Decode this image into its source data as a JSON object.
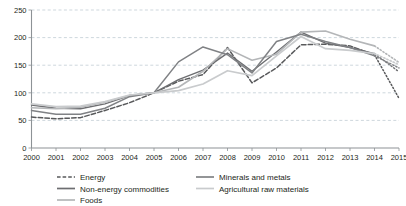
{
  "chart_data": {
    "type": "line",
    "title": "",
    "subtitle": "",
    "xlabel": "",
    "ylabel": "",
    "index_note": "Index, 2005 = 100",
    "x": [
      2000,
      2001,
      2002,
      2003,
      2004,
      2005,
      2006,
      2007,
      2008,
      2009,
      2010,
      2011,
      2012,
      2013,
      2014,
      2015
    ],
    "xtick_labels": [
      "2000",
      "2001",
      "2002",
      "2003",
      "2004",
      "2005",
      "2006",
      "2007",
      "2008",
      "2009",
      "2010",
      "2011",
      "2012",
      "2013",
      "2014",
      "2015"
    ],
    "ytick_labels": [
      "0",
      "50",
      "100",
      "150",
      "200",
      "250"
    ],
    "yticks": [
      0,
      50,
      100,
      150,
      200,
      250
    ],
    "ylim": [
      0,
      250
    ],
    "xlim": [
      2000,
      2015
    ],
    "grid": "horizontal-dashed",
    "legend_position": "bottom",
    "forecast_from": 2014,
    "forecast_style": "dotted",
    "series": [
      {
        "name": "Energy",
        "color": "#58595b",
        "style": "dashed",
        "width": 1.5,
        "values": [
          56,
          53,
          55,
          68,
          82,
          100,
          121,
          133,
          182,
          118,
          145,
          187,
          188,
          185,
          169,
          90
        ]
      },
      {
        "name": "Non-energy commodities",
        "color": "#6d6e71",
        "style": "solid",
        "width": 1.4,
        "values": [
          78,
          72,
          71,
          80,
          95,
          100,
          124,
          141,
          172,
          139,
          174,
          210,
          190,
          182,
          171,
          138
        ]
      },
      {
        "name": "Foods",
        "color": "#b4b6b8",
        "style": "solid",
        "width": 1.6,
        "values": [
          73,
          71,
          74,
          83,
          95,
          100,
          110,
          139,
          180,
          159,
          170,
          210,
          212,
          197,
          185,
          155
        ]
      },
      {
        "name": "Minerals and metals",
        "color": "#808285",
        "style": "solid",
        "width": 1.5,
        "values": [
          68,
          61,
          61,
          72,
          93,
          100,
          156,
          183,
          169,
          136,
          193,
          206,
          193,
          182,
          167,
          145
        ]
      },
      {
        "name": "Agricultural raw materials",
        "color": "#c9cbcd",
        "style": "solid",
        "width": 1.7,
        "values": [
          80,
          75,
          76,
          84,
          96,
          100,
          104,
          116,
          140,
          131,
          167,
          202,
          180,
          177,
          171,
          151
        ]
      }
    ]
  },
  "legend": {
    "items": [
      {
        "label": "Energy",
        "color": "#58595b",
        "style": "dashed"
      },
      {
        "label": "Non-energy commodities",
        "color": "#6d6e71",
        "style": "solid"
      },
      {
        "label": "Foods",
        "color": "#b4b6b8",
        "style": "solid"
      },
      {
        "label": "Minerals and metals",
        "color": "#808285",
        "style": "solid"
      },
      {
        "label": "Agricultural raw materials",
        "color": "#c9cbcd",
        "style": "solid"
      }
    ]
  }
}
